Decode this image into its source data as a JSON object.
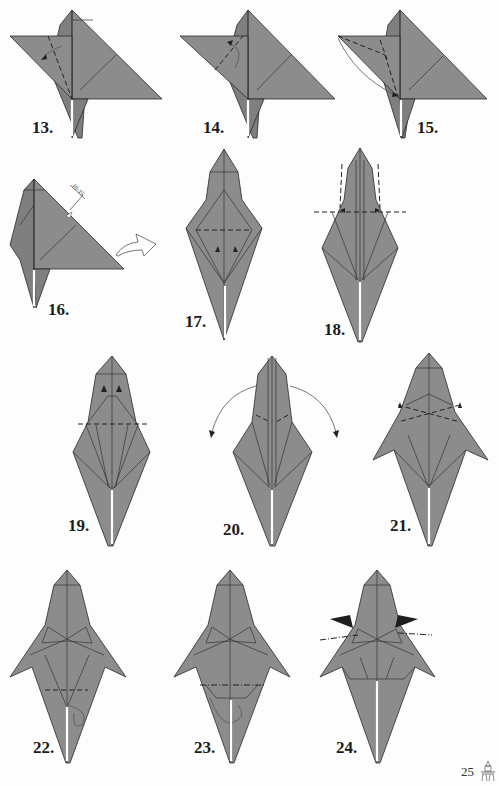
{
  "page": {
    "number": "25",
    "logo_icon": "origami-figure-logo-icon",
    "paper_color": "#8c8c8c",
    "line_color": "#2a2a2a",
    "background": "#fdfdfd"
  },
  "steps": [
    {
      "label": "13.",
      "symbols": [
        "valley-fold-dashed-line",
        "fold-arrow"
      ]
    },
    {
      "label": "14.",
      "symbols": [
        "valley-fold-dashed-line",
        "curved-unfold-arrow"
      ]
    },
    {
      "label": "15.",
      "symbols": [
        "valley-fold-dashed-lines",
        "squash-arrows",
        "swing-arc"
      ]
    },
    {
      "label": "16.",
      "symbols": [
        "measurement-marker",
        "turn-over-arrow"
      ],
      "measurement": "10-15"
    },
    {
      "label": "17.",
      "symbols": [
        "valley-fold-dashed-line",
        "fold-down-arrows"
      ]
    },
    {
      "label": "18.",
      "symbols": [
        "valley-fold-dashed-line",
        "fold-arrows"
      ]
    },
    {
      "label": "19.",
      "symbols": [
        "valley-fold-dashed-line",
        "fold-up-arrows"
      ]
    },
    {
      "label": "20.",
      "symbols": [
        "valley-fold-dashed-lines",
        "swing-out-arrows"
      ]
    },
    {
      "label": "21.",
      "symbols": [
        "valley-fold-dashed-lines",
        "fold-arrows"
      ]
    },
    {
      "label": "22.",
      "symbols": [
        "valley-fold-dashed-line",
        "tuck-arrow"
      ]
    },
    {
      "label": "23.",
      "symbols": [
        "mountain-fold-line",
        "tuck-arrow"
      ]
    },
    {
      "label": "24.",
      "symbols": [
        "mountain-fold-lines",
        "push-in-arrowheads"
      ]
    }
  ]
}
